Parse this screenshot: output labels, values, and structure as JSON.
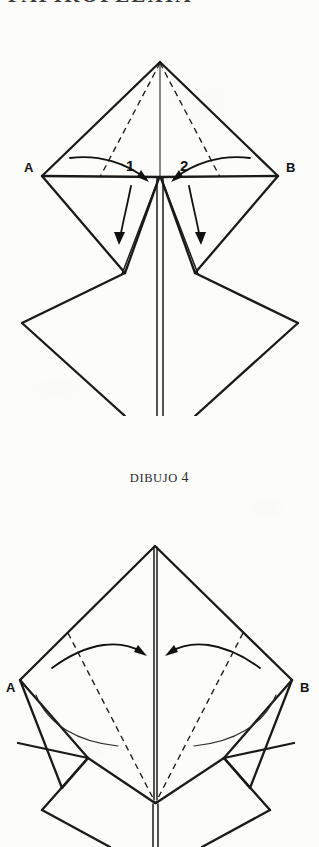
{
  "page": {
    "background_color": "#fcfcfb",
    "ink_color": "#1a1a1a",
    "running_head": "PAPIROFLEXIA"
  },
  "caption": {
    "word": "DIBUJO",
    "number": "4"
  },
  "figures": [
    {
      "id": "figure-1",
      "name": "origami-diagram-step-4",
      "vertex_labels": [
        {
          "text": "A",
          "side": "left"
        },
        {
          "text": "B",
          "side": "right"
        }
      ],
      "fold_labels": [
        {
          "text": "1",
          "side": "left"
        },
        {
          "text": "2",
          "side": "right"
        }
      ],
      "arrows": [
        {
          "name": "fold-arrow-1",
          "direction": "inward-right",
          "style": "curved"
        },
        {
          "name": "fold-arrow-2",
          "direction": "inward-left",
          "style": "curved"
        },
        {
          "name": "flap-arrow-left",
          "direction": "downward",
          "style": "curved"
        },
        {
          "name": "flap-arrow-right",
          "direction": "downward",
          "style": "curved"
        }
      ],
      "fold_lines": "dashed",
      "shape": "kite-over-diamond"
    },
    {
      "id": "figure-2",
      "name": "origami-diagram-step-5",
      "vertex_labels": [
        {
          "text": "A",
          "side": "left"
        },
        {
          "text": "B",
          "side": "right"
        }
      ],
      "fold_labels": [],
      "arrows": [
        {
          "name": "fold-arrow-left",
          "direction": "inward-right",
          "style": "curved"
        },
        {
          "name": "fold-arrow-right",
          "direction": "inward-left",
          "style": "curved"
        }
      ],
      "fold_lines": "dashed",
      "shape": "kite-over-two-diamonds"
    }
  ]
}
